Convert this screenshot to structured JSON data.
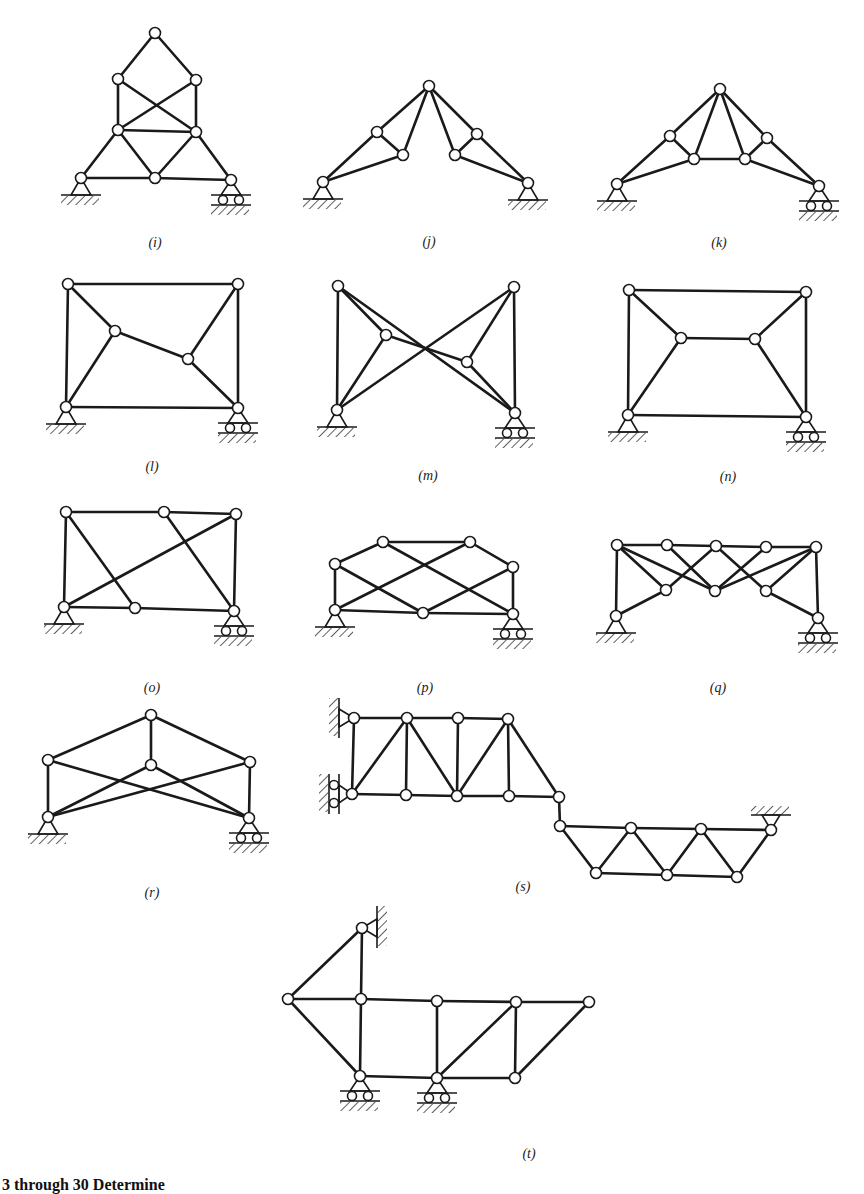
{
  "figure": {
    "style": {
      "stroke": "#1a1a1a",
      "node_fill": "#ffffff",
      "background": "#ffffff"
    },
    "caption_fragment": "3 through 30   Determine",
    "panels": [
      {
        "id": "i",
        "label": "(i)",
        "label_pos": [
          155,
          243
        ],
        "nodes": [
          [
            155,
            33
          ],
          [
            118,
            79
          ],
          [
            196,
            80
          ],
          [
            118,
            130
          ],
          [
            196,
            132
          ],
          [
            81,
            178
          ],
          [
            155,
            178
          ],
          [
            231,
            180
          ]
        ],
        "members": [
          [
            0,
            1
          ],
          [
            0,
            2
          ],
          [
            1,
            3
          ],
          [
            2,
            4
          ],
          [
            1,
            4
          ],
          [
            2,
            3
          ],
          [
            3,
            4
          ],
          [
            3,
            5
          ],
          [
            3,
            6
          ],
          [
            4,
            6
          ],
          [
            4,
            7
          ],
          [
            5,
            6
          ],
          [
            6,
            7
          ]
        ],
        "supports": [
          {
            "type": "pin",
            "node": 5
          },
          {
            "type": "roller",
            "node": 7
          }
        ]
      },
      {
        "id": "j",
        "label": "(j)",
        "label_pos": [
          429,
          242
        ],
        "nodes": [
          [
            429,
            86
          ],
          [
            377,
            132
          ],
          [
            403,
            155
          ],
          [
            455,
            155
          ],
          [
            477,
            134
          ],
          [
            323,
            182
          ],
          [
            528,
            183
          ]
        ],
        "members": [
          [
            0,
            1
          ],
          [
            0,
            2
          ],
          [
            1,
            2
          ],
          [
            1,
            5
          ],
          [
            2,
            5
          ],
          [
            0,
            4
          ],
          [
            0,
            3
          ],
          [
            3,
            4
          ],
          [
            4,
            6
          ],
          [
            3,
            6
          ]
        ],
        "supports": [
          {
            "type": "pin",
            "node": 5
          },
          {
            "type": "pin",
            "node": 6
          }
        ]
      },
      {
        "id": "k",
        "label": "(k)",
        "label_pos": [
          719,
          243
        ],
        "nodes": [
          [
            720,
            89
          ],
          [
            670,
            136
          ],
          [
            694,
            159
          ],
          [
            745,
            159
          ],
          [
            767,
            138
          ],
          [
            617,
            184
          ],
          [
            819,
            186
          ]
        ],
        "members": [
          [
            0,
            1
          ],
          [
            0,
            2
          ],
          [
            0,
            3
          ],
          [
            0,
            4
          ],
          [
            1,
            2
          ],
          [
            3,
            4
          ],
          [
            2,
            3
          ],
          [
            1,
            5
          ],
          [
            2,
            5
          ],
          [
            4,
            6
          ],
          [
            3,
            6
          ]
        ],
        "supports": [
          {
            "type": "pin",
            "node": 5
          },
          {
            "type": "roller",
            "node": 6
          }
        ]
      },
      {
        "id": "l",
        "label": "(l)",
        "label_pos": [
          152,
          467
        ],
        "nodes": [
          [
            68,
            284
          ],
          [
            238,
            284
          ],
          [
            115,
            331
          ],
          [
            188,
            359
          ],
          [
            66,
            407
          ],
          [
            238,
            408
          ]
        ],
        "members": [
          [
            0,
            1
          ],
          [
            0,
            4
          ],
          [
            1,
            5
          ],
          [
            4,
            5
          ],
          [
            0,
            2
          ],
          [
            2,
            4
          ],
          [
            2,
            3
          ],
          [
            3,
            1
          ],
          [
            3,
            5
          ]
        ],
        "supports": [
          {
            "type": "pin",
            "node": 4
          },
          {
            "type": "roller",
            "node": 5
          }
        ]
      },
      {
        "id": "m",
        "label": "(m)",
        "label_pos": [
          428,
          476
        ],
        "nodes": [
          [
            338,
            286
          ],
          [
            514,
            287
          ],
          [
            386,
            335
          ],
          [
            467,
            362
          ],
          [
            337,
            410
          ],
          [
            515,
            413
          ]
        ],
        "members": [
          [
            0,
            4
          ],
          [
            1,
            5
          ],
          [
            0,
            2
          ],
          [
            2,
            3
          ],
          [
            3,
            5
          ],
          [
            0,
            5
          ],
          [
            1,
            4
          ],
          [
            2,
            4
          ],
          [
            1,
            3
          ]
        ],
        "supports": [
          {
            "type": "pin",
            "node": 4
          },
          {
            "type": "roller",
            "node": 5
          }
        ]
      },
      {
        "id": "n",
        "label": "(n)",
        "label_pos": [
          728,
          477
        ],
        "nodes": [
          [
            629,
            290
          ],
          [
            806,
            292
          ],
          [
            681,
            338
          ],
          [
            755,
            339
          ],
          [
            628,
            415
          ],
          [
            806,
            417
          ]
        ],
        "members": [
          [
            0,
            1
          ],
          [
            0,
            4
          ],
          [
            1,
            5
          ],
          [
            4,
            5
          ],
          [
            0,
            2
          ],
          [
            2,
            3
          ],
          [
            3,
            1
          ],
          [
            2,
            4
          ],
          [
            3,
            5
          ]
        ],
        "supports": [
          {
            "type": "pin",
            "node": 4
          },
          {
            "type": "roller",
            "node": 5
          }
        ]
      },
      {
        "id": "o",
        "label": "(o)",
        "label_pos": [
          152,
          688
        ],
        "nodes": [
          [
            66,
            512
          ],
          [
            164,
            512
          ],
          [
            236,
            514
          ],
          [
            64,
            607
          ],
          [
            135,
            608
          ],
          [
            234,
            611
          ]
        ],
        "members": [
          [
            0,
            1
          ],
          [
            1,
            2
          ],
          [
            0,
            3
          ],
          [
            2,
            5
          ],
          [
            3,
            4
          ],
          [
            4,
            5
          ],
          [
            0,
            4
          ],
          [
            3,
            2
          ],
          [
            1,
            5
          ]
        ],
        "supports": [
          {
            "type": "pin",
            "node": 3
          },
          {
            "type": "roller",
            "node": 5
          }
        ]
      },
      {
        "id": "p",
        "label": "(p)",
        "label_pos": [
          425,
          688
        ],
        "nodes": [
          [
            383,
            542
          ],
          [
            470,
            542
          ],
          [
            335,
            564
          ],
          [
            513,
            567
          ],
          [
            335,
            610
          ],
          [
            423,
            613
          ],
          [
            513,
            614
          ]
        ],
        "members": [
          [
            0,
            1
          ],
          [
            2,
            0
          ],
          [
            1,
            3
          ],
          [
            2,
            4
          ],
          [
            3,
            6
          ],
          [
            4,
            5
          ],
          [
            5,
            6
          ],
          [
            2,
            5
          ],
          [
            0,
            6
          ],
          [
            4,
            1
          ],
          [
            5,
            3
          ]
        ],
        "supports": [
          {
            "type": "pin",
            "node": 4
          },
          {
            "type": "roller",
            "node": 6
          }
        ]
      },
      {
        "id": "q",
        "label": "(q)",
        "label_pos": [
          718,
          688
        ],
        "nodes": [
          [
            617,
            545
          ],
          [
            667,
            545
          ],
          [
            716,
            546
          ],
          [
            766,
            547
          ],
          [
            816,
            547
          ],
          [
            666,
            590
          ],
          [
            715,
            591
          ],
          [
            766,
            591
          ],
          [
            616,
            616
          ],
          [
            818,
            618
          ]
        ],
        "members": [
          [
            0,
            1
          ],
          [
            1,
            2
          ],
          [
            2,
            3
          ],
          [
            3,
            4
          ],
          [
            0,
            8
          ],
          [
            4,
            9
          ],
          [
            8,
            5
          ],
          [
            5,
            2
          ],
          [
            0,
            5
          ],
          [
            0,
            6
          ],
          [
            1,
            6
          ],
          [
            2,
            7
          ],
          [
            3,
            6
          ],
          [
            4,
            6
          ],
          [
            4,
            7
          ],
          [
            7,
            9
          ]
        ],
        "supports": [
          {
            "type": "pin",
            "node": 8
          },
          {
            "type": "roller",
            "node": 9
          }
        ]
      },
      {
        "id": "r",
        "label": "(r)",
        "label_pos": [
          152,
          893
        ],
        "nodes": [
          [
            151,
            715
          ],
          [
            48,
            760
          ],
          [
            151,
            765
          ],
          [
            250,
            762
          ],
          [
            48,
            817
          ],
          [
            249,
            818
          ]
        ],
        "members": [
          [
            0,
            1
          ],
          [
            0,
            3
          ],
          [
            0,
            2
          ],
          [
            1,
            4
          ],
          [
            3,
            5
          ],
          [
            1,
            5
          ],
          [
            3,
            4
          ],
          [
            2,
            4
          ],
          [
            2,
            5
          ]
        ],
        "supports": [
          {
            "type": "pin",
            "node": 4
          },
          {
            "type": "roller",
            "node": 5
          }
        ]
      },
      {
        "id": "s",
        "label": "(s)",
        "label_pos": [
          523,
          887
        ],
        "nodes": [
          [
            354,
            718
          ],
          [
            407,
            718
          ],
          [
            458,
            718
          ],
          [
            508,
            719
          ],
          [
            352,
            794
          ],
          [
            406,
            795
          ],
          [
            457,
            796
          ],
          [
            509,
            796
          ],
          [
            559,
            797
          ],
          [
            560,
            826
          ],
          [
            631,
            828
          ],
          [
            701,
            829
          ],
          [
            771,
            830
          ],
          [
            596,
            873
          ],
          [
            667,
            875
          ],
          [
            737,
            877
          ]
        ],
        "members": [
          [
            0,
            1
          ],
          [
            1,
            2
          ],
          [
            2,
            3
          ],
          [
            0,
            4
          ],
          [
            4,
            5
          ],
          [
            5,
            6
          ],
          [
            6,
            7
          ],
          [
            7,
            8
          ],
          [
            1,
            5
          ],
          [
            4,
            1
          ],
          [
            1,
            6
          ],
          [
            2,
            6
          ],
          [
            6,
            3
          ],
          [
            3,
            7
          ],
          [
            3,
            8
          ],
          [
            8,
            9
          ],
          [
            9,
            10
          ],
          [
            10,
            11
          ],
          [
            11,
            12
          ],
          [
            9,
            13
          ],
          [
            13,
            14
          ],
          [
            14,
            15
          ],
          [
            13,
            10
          ],
          [
            10,
            14
          ],
          [
            14,
            11
          ],
          [
            11,
            15
          ],
          [
            15,
            12
          ]
        ],
        "supports": [
          {
            "type": "wall-pin",
            "node": 0
          },
          {
            "type": "wall-roller",
            "node": 4
          },
          {
            "type": "ceiling-pin",
            "node": 12
          }
        ]
      },
      {
        "id": "t",
        "label": "(t)",
        "label_pos": [
          529,
          1154
        ],
        "nodes": [
          [
            362,
            928
          ],
          [
            288,
            999
          ],
          [
            361,
            999
          ],
          [
            437,
            1001
          ],
          [
            516,
            1002
          ],
          [
            589,
            1002
          ],
          [
            360,
            1076
          ],
          [
            437,
            1078
          ],
          [
            515,
            1078
          ]
        ],
        "members": [
          [
            0,
            1
          ],
          [
            0,
            2
          ],
          [
            1,
            2
          ],
          [
            2,
            3
          ],
          [
            3,
            4
          ],
          [
            4,
            5
          ],
          [
            1,
            6
          ],
          [
            2,
            6
          ],
          [
            6,
            7
          ],
          [
            7,
            8
          ],
          [
            3,
            7
          ],
          [
            7,
            4
          ],
          [
            4,
            8
          ],
          [
            8,
            5
          ]
        ],
        "supports": [
          {
            "type": "wall-pin-right",
            "node": 0
          },
          {
            "type": "roller",
            "node": 6
          },
          {
            "type": "roller",
            "node": 7
          }
        ]
      }
    ]
  }
}
